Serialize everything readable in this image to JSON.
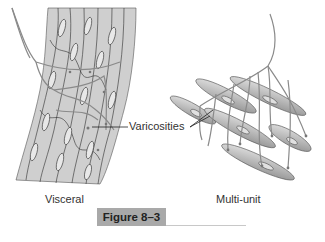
{
  "figure": {
    "caption": "Figure 8–3",
    "labels": {
      "left_panel": "Visceral",
      "right_panel": "Multi-unit",
      "pointer": "Varicosities"
    },
    "colors": {
      "tissue_fill": "#c8c8c8",
      "cell_outline": "#3a3a3a",
      "nerve": "#9a9a9a",
      "caption_bg": "#a9a9a9"
    }
  }
}
